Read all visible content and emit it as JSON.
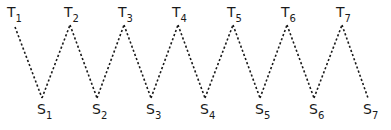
{
  "diagram": {
    "type": "zigzag",
    "line_style": "dotted",
    "line_color": "#1a1a1a",
    "background": "#ffffff",
    "top_nodes": [
      {
        "base": "T",
        "sub": "1",
        "x": 15,
        "y": 27
      },
      {
        "base": "T",
        "sub": "2",
        "x": 70,
        "y": 25
      },
      {
        "base": "T",
        "sub": "3",
        "x": 124,
        "y": 25
      },
      {
        "base": "T",
        "sub": "4",
        "x": 178,
        "y": 25
      },
      {
        "base": "T",
        "sub": "5",
        "x": 233,
        "y": 25
      },
      {
        "base": "T",
        "sub": "6",
        "x": 287,
        "y": 25
      },
      {
        "base": "T",
        "sub": "7",
        "x": 342,
        "y": 25
      }
    ],
    "bottom_nodes": [
      {
        "base": "S",
        "sub": "1",
        "x": 42,
        "y": 98
      },
      {
        "base": "S",
        "sub": "2",
        "x": 97,
        "y": 98
      },
      {
        "base": "S",
        "sub": "3",
        "x": 151,
        "y": 98
      },
      {
        "base": "S",
        "sub": "4",
        "x": 205,
        "y": 98
      },
      {
        "base": "S",
        "sub": "5",
        "x": 260,
        "y": 98
      },
      {
        "base": "S",
        "sub": "6",
        "x": 314,
        "y": 98
      },
      {
        "base": "S",
        "sub": "7",
        "x": 368,
        "y": 98
      }
    ],
    "edges_description": "T1-S1-T2-S2-T3-S3-T4-S4-T5-S5-T6-S6-T7-S7"
  }
}
